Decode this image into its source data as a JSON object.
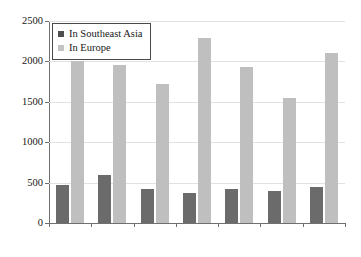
{
  "chart_data": {
    "type": "bar",
    "title": "",
    "subtitle": "",
    "xlabel": "",
    "ylabel": "",
    "categories": [
      "1630–39",
      "1640–49",
      "1650–59",
      "1660–69",
      "1670–79",
      "1680–89",
      "1690–99"
    ],
    "series": [
      {
        "name": "In Southeast Asia",
        "color": "#6b6b6b",
        "values": [
          470,
          600,
          420,
          370,
          425,
          400,
          450
        ]
      },
      {
        "name": "In Europe",
        "color": "#bfbfbf",
        "values": [
          2000,
          1950,
          1720,
          2290,
          1930,
          1550,
          2100
        ]
      }
    ],
    "ylim": [
      0,
      2500
    ],
    "yticks": [
      0,
      500,
      1000,
      1500,
      2000,
      2500
    ],
    "ytick_labels": [
      "0",
      "500",
      "1000",
      "1500",
      "2000",
      "2500"
    ],
    "grid": true,
    "legend_position": "top-left"
  },
  "legend": {
    "entries": [
      {
        "label": "In Southeast Asia"
      },
      {
        "label": "In Europe"
      }
    ]
  }
}
